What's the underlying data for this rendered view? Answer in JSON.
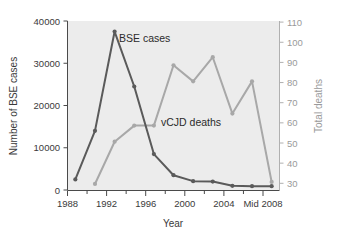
{
  "chart_data": {
    "type": "line",
    "title": "",
    "xlabel": "Year",
    "ylabel": "Number of BSE cases",
    "y2label": "Total deaths",
    "grid": false,
    "legend_position": "inline-annotations",
    "x": [
      1988,
      1990,
      1992,
      1994,
      1996,
      1998,
      2000,
      2002,
      2004,
      2006,
      2008
    ],
    "xtick_labels": [
      "1988",
      "1992",
      "1996",
      "2000",
      "2004",
      "Mid 2008"
    ],
    "xtick_values": [
      1988,
      1992,
      1996,
      2000,
      2004,
      2008
    ],
    "xminor_tick_values": [
      1990,
      1994,
      1998,
      2002,
      2006
    ],
    "xlim": [
      1987.2,
      2008.8
    ],
    "ylim": [
      0,
      40000
    ],
    "ytick_labels": [
      "0",
      "10000",
      "20000",
      "30000",
      "40000"
    ],
    "ytick_values": [
      0,
      10000,
      20000,
      30000,
      40000
    ],
    "y2lim": [
      28,
      112
    ],
    "y2tick_labels": [
      "30",
      "40",
      "50",
      "60",
      "70",
      "80",
      "90",
      "100",
      "110"
    ],
    "y2tick_values": [
      30,
      40,
      50,
      60,
      70,
      80,
      90,
      100,
      110
    ],
    "series": [
      {
        "name": "BSE cases",
        "axis": "left",
        "color": "#5a5a5a",
        "label_text": "BSE cases",
        "values": [
          2500,
          14000,
          37500,
          24500,
          8500,
          3500,
          2100,
          2000,
          1000,
          900,
          900
        ]
      },
      {
        "name": "vCJD deaths",
        "axis": "right",
        "color": "#a8a8a8",
        "label_text": "vCJD deaths",
        "values": [
          null,
          31,
          52,
          60,
          60,
          90,
          82,
          94,
          66,
          82,
          32
        ]
      }
    ],
    "annotations": [
      {
        "text": "BSE cases",
        "x": 1993.2,
        "y_px": 38
      },
      {
        "text": "vCJD deaths",
        "x": 1998.0,
        "y_px": 122
      }
    ]
  },
  "axes": {
    "x_title": "Year",
    "y_left_title": "Number of BSE cases",
    "y_right_title": "Total deaths"
  },
  "colors": {
    "plot_background": "#ececec",
    "page_background": "#ffffff",
    "bse_line": "#5a5a5a",
    "vcjd_line": "#a8a8a8",
    "left_axis": "#4a4a4a",
    "right_axis": "#b0b0b0"
  }
}
